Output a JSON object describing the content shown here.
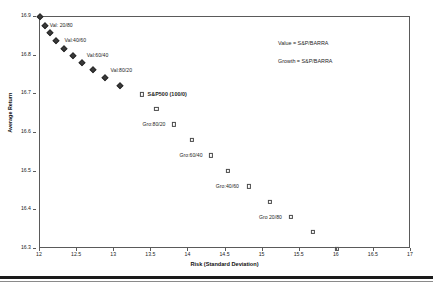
{
  "chart_data": {
    "type": "scatter",
    "title": "",
    "xlabel": "Risk (Standard Deviation)",
    "ylabel": "Average Return",
    "xlim": [
      12,
      17
    ],
    "ylim": [
      16.3,
      16.9
    ],
    "xticks": [
      "12",
      "12.5",
      "13",
      "13.5",
      "14",
      "14.5",
      "15",
      "15.5",
      "16",
      "16.5",
      "17"
    ],
    "xtick_values": [
      12,
      12.5,
      13,
      13.5,
      14,
      14.5,
      15,
      15.5,
      16,
      16.5,
      17
    ],
    "yticks": [
      "16.9",
      "16.8",
      "16.7",
      "16.6",
      "16.5",
      "16.4",
      "16.3"
    ],
    "ytick_values": [
      16.9,
      16.8,
      16.7,
      16.6,
      16.5,
      16.4,
      16.3
    ],
    "grid": false,
    "legend_position": "top-right",
    "series": [
      {
        "name": "Value",
        "marker": "filled-diamond",
        "points": [
          {
            "x": 12.0,
            "y": 16.9
          },
          {
            "x": 12.07,
            "y": 16.878
          },
          {
            "x": 12.13,
            "y": 16.858
          },
          {
            "x": 12.21,
            "y": 16.838
          },
          {
            "x": 12.32,
            "y": 16.818
          },
          {
            "x": 12.44,
            "y": 16.8
          },
          {
            "x": 12.57,
            "y": 16.782
          },
          {
            "x": 12.72,
            "y": 16.762
          },
          {
            "x": 12.88,
            "y": 16.742
          },
          {
            "x": 13.08,
            "y": 16.722
          }
        ]
      },
      {
        "name": "Growth",
        "marker": "open-square",
        "points": [
          {
            "x": 13.37,
            "y": 16.7
          },
          {
            "x": 13.57,
            "y": 16.662
          },
          {
            "x": 13.8,
            "y": 16.622
          },
          {
            "x": 14.05,
            "y": 16.582
          },
          {
            "x": 14.3,
            "y": 16.542
          },
          {
            "x": 14.53,
            "y": 16.502
          },
          {
            "x": 14.82,
            "y": 16.462
          },
          {
            "x": 15.1,
            "y": 16.422
          },
          {
            "x": 15.38,
            "y": 16.382
          },
          {
            "x": 15.68,
            "y": 16.345
          },
          {
            "x": 16.0,
            "y": 16.3
          }
        ]
      }
    ],
    "annotations": [
      {
        "text": "Val: 20/80",
        "x": 12.13,
        "y": 16.878,
        "bold": false
      },
      {
        "text": "Val:40/60",
        "x": 12.33,
        "y": 16.838,
        "bold": false
      },
      {
        "text": "Val:60/40",
        "x": 12.63,
        "y": 16.8,
        "bold": false
      },
      {
        "text": "Val:80/20",
        "x": 12.95,
        "y": 16.762,
        "bold": false
      },
      {
        "text": "S&P500 (100/0)",
        "x": 13.45,
        "y": 16.7,
        "bold": true
      },
      {
        "text": "Gro:80/20",
        "x": 13.38,
        "y": 16.622,
        "bold": false
      },
      {
        "text": "Gro:60/40",
        "x": 13.88,
        "y": 16.542,
        "bold": false
      },
      {
        "text": "Gro:40/60",
        "x": 14.37,
        "y": 16.462,
        "bold": false
      },
      {
        "text": "Gro 20/80",
        "x": 14.95,
        "y": 16.382,
        "bold": false
      }
    ],
    "legend_entries": [
      {
        "text": "Value = S&P/BARRA"
      },
      {
        "text": "Growth = S&P/BARRA"
      }
    ]
  }
}
